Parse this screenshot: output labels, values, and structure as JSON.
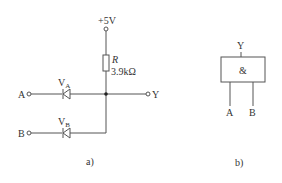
{
  "figure_a": {
    "caption": "a)",
    "supply": {
      "label": "+5V"
    },
    "resistor": {
      "name": "R",
      "value": "3.9kΩ"
    },
    "inputs": [
      {
        "label": "A",
        "diode": "V",
        "diode_sub": "A"
      },
      {
        "label": "B",
        "diode": "V",
        "diode_sub": "B"
      }
    ],
    "output": {
      "label": "Y"
    }
  },
  "figure_b": {
    "caption": "b)",
    "gate_symbol": "&",
    "output_label": "Y",
    "input_labels": [
      "A",
      "B"
    ]
  },
  "colors": {
    "line": "#555555",
    "text": "#333333",
    "background": "#ffffff"
  }
}
